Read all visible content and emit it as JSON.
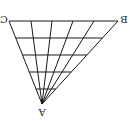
{
  "diagram": {
    "type": "triangle-fan-grid",
    "stroke_color": "#1a1a1a",
    "background": "#ffffff",
    "labels_rotated_deg": 180,
    "vertices": {
      "A": {
        "label": "A",
        "x": 42,
        "y": 104
      },
      "B": {
        "label": "B",
        "x": 118,
        "y": 21
      },
      "C": {
        "label": "C",
        "x": 9,
        "y": 21
      }
    },
    "fan_line_endpoints_x_on_CB": [
      9,
      31,
      52,
      73,
      94,
      118
    ],
    "horizontal_lines_y": [
      21,
      38,
      55,
      72,
      89
    ],
    "label_text": {
      "A": "A",
      "B": "B",
      "C": "C"
    }
  }
}
